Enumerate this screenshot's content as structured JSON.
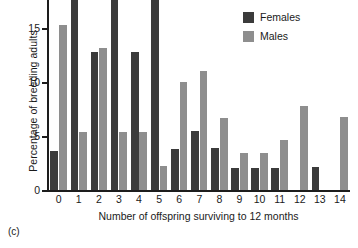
{
  "caption": "(c)",
  "legend": {
    "position": "top-right",
    "entries": [
      {
        "label": "Females",
        "color": "#3b3b3b"
      },
      {
        "label": "Males",
        "color": "#8e8e8e"
      }
    ]
  },
  "chart_data": {
    "type": "bar",
    "title": "",
    "subtitle": "",
    "xlabel": "Number of offspring surviving to 12 months",
    "ylabel": "Percentage of breeding adults",
    "categories": [
      "0",
      "1",
      "2",
      "3",
      "4",
      "5",
      "6",
      "7",
      "8",
      "9",
      "10",
      "11",
      "12",
      "13",
      "14"
    ],
    "series": [
      {
        "name": "Females",
        "color": "#3b3b3b",
        "values": [
          3.6,
          17.6,
          12.8,
          17.6,
          12.8,
          17.6,
          3.8,
          5.5,
          3.9,
          2.0,
          2.0,
          2.0,
          0,
          2.1,
          0
        ]
      },
      {
        "name": "Males",
        "color": "#8e8e8e",
        "values": [
          15.3,
          5.4,
          13.2,
          5.4,
          5.4,
          2.2,
          10.0,
          11.0,
          6.7,
          3.4,
          3.4,
          4.6,
          7.8,
          0,
          6.8
        ]
      }
    ],
    "ylim": [
      0,
      17.6
    ],
    "yticks": [
      0,
      5,
      10,
      15
    ],
    "ytick_labels": [
      "0",
      "5",
      "10",
      "15"
    ],
    "grid": false
  }
}
